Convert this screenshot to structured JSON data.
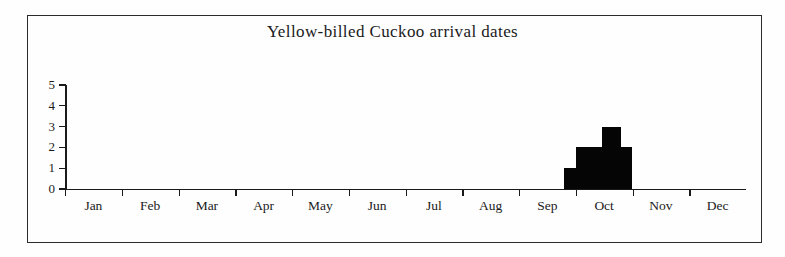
{
  "chart_data": {
    "type": "bar",
    "title": "Yellow-billed Cuckoo arrival dates",
    "xlabel": "",
    "ylabel": "",
    "ylim": [
      0,
      5
    ],
    "yticks": [
      "0",
      "1",
      "2",
      "3",
      "4",
      "5"
    ],
    "grid": false,
    "legend": "none",
    "categories": [
      "Jan",
      "Feb",
      "Mar",
      "Apr",
      "May",
      "Jun",
      "Jul",
      "Aug",
      "Sep",
      "Oct",
      "Nov",
      "Dec"
    ],
    "bars": [
      {
        "label": "late Sep",
        "value": 1,
        "start_month": 8,
        "start_fraction": 0.79,
        "end_month": 8,
        "end_fraction": 1.0
      },
      {
        "label": "early Oct",
        "value": 2,
        "start_month": 9,
        "start_fraction": 0.0,
        "end_month": 9,
        "end_fraction": 0.47
      },
      {
        "label": "mid Oct",
        "value": 3,
        "start_month": 9,
        "start_fraction": 0.47,
        "end_month": 9,
        "end_fraction": 0.79
      },
      {
        "label": "late Oct",
        "value": 2,
        "start_month": 9,
        "start_fraction": 0.79,
        "end_month": 10,
        "end_fraction": 0.0
      }
    ],
    "values": [
      0,
      0,
      0,
      0,
      0,
      0,
      0,
      0,
      1,
      3,
      0,
      0
    ],
    "bar_color": "#050505",
    "axis_color": "#1a1a1a",
    "background_color": "#fefefe"
  }
}
